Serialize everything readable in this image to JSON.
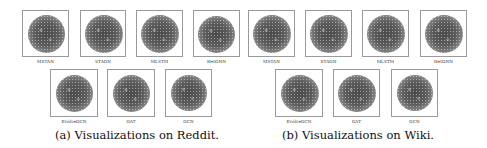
{
  "figure": {
    "subfigures": [
      {
        "caption": "(a) Visualizations on Reddit.",
        "dataset": "Reddit",
        "panels": [
          {
            "label": "MSTAN"
          },
          {
            "label": "STAGN"
          },
          {
            "label": "MLSTM"
          },
          {
            "label": "HetGNN"
          },
          {
            "label": "EvolveGCN"
          },
          {
            "label": "GAT"
          },
          {
            "label": "GCN"
          }
        ]
      },
      {
        "caption": "(b) Visualizations on Wiki.",
        "dataset": "Wiki",
        "panels": [
          {
            "label": "MSTAN"
          },
          {
            "label": "STAGN"
          },
          {
            "label": "MLSTM"
          },
          {
            "label": "HetGNN"
          },
          {
            "label": "EvolveGCN"
          },
          {
            "label": "GAT"
          },
          {
            "label": "GCN"
          }
        ]
      }
    ]
  }
}
